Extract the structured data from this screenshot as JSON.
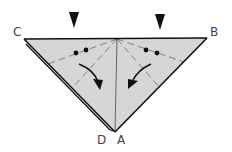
{
  "diagram": {
    "type": "origami-fold-step",
    "colors": {
      "paper_fill": "#d6d6d6",
      "outline": "#111111",
      "crease": "#6a6a6a",
      "background": "#ffffff"
    },
    "points": {
      "C": "C",
      "B": "B",
      "D": "D",
      "A": "A"
    },
    "markers": [
      {
        "name": "push-marker-left",
        "symbol": "down-triangle"
      },
      {
        "name": "push-marker-right",
        "symbol": "down-triangle"
      }
    ],
    "annotations": [
      {
        "name": "double-dot-left",
        "symbol": "two-dots"
      },
      {
        "name": "double-dot-right",
        "symbol": "two-dots"
      },
      {
        "name": "fold-arrow-left",
        "symbol": "curved-arrow-down-right"
      },
      {
        "name": "fold-arrow-right",
        "symbol": "curved-arrow-down-left"
      }
    ]
  }
}
